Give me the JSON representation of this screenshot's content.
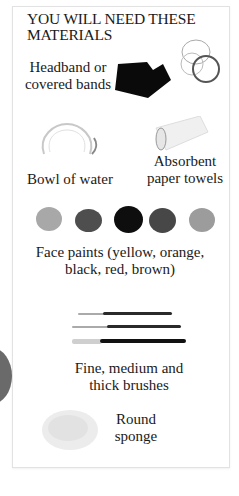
{
  "title": "YOU WILL NEED THESE MATERIALS",
  "title_lines": [
    "YOU WILL NEED THESE",
    "MATERIALS"
  ],
  "items": [
    {
      "id": "headband",
      "label_lines": [
        "Headband or",
        "covered bands"
      ],
      "icon": "headband-icon"
    },
    {
      "id": "bowl",
      "label_lines": [
        "Bowl of water"
      ],
      "icon": "bowl-icon"
    },
    {
      "id": "towels",
      "label_lines": [
        "Absorbent",
        "paper towels"
      ],
      "icon": "paper-towel-icon"
    },
    {
      "id": "paints",
      "label_lines": [
        "Face paints (yellow, orange,",
        "black, red, brown)"
      ],
      "icon": "face-paint-icon"
    },
    {
      "id": "brushes",
      "label_lines": [
        "Fine, medium and",
        "thick brushes"
      ],
      "icon": "brush-icon"
    },
    {
      "id": "sponge",
      "label_lines": [
        "Round",
        "sponge"
      ],
      "icon": "sponge-icon"
    }
  ],
  "paint_colors": [
    "#a8a8a8",
    "#4a4a4a",
    "#0e0e0e",
    "#444444",
    "#9a9a9a"
  ],
  "colors": {
    "text": "#1a1a1a",
    "border": "#e2e2e2",
    "background": "#ffffff"
  }
}
